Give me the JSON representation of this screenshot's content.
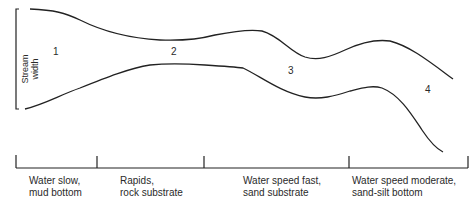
{
  "diagram": {
    "type": "stream-profile",
    "width_axis_label_line1": "Stream",
    "width_axis_label_line2": "width",
    "zones": [
      {
        "number": "1",
        "line1": "Water slow,",
        "line2": "mud bottom"
      },
      {
        "number": "2",
        "line1": "Rapids,",
        "line2": "rock substrate"
      },
      {
        "number": "3",
        "line1": "Water speed fast,",
        "line2": "sand substrate"
      },
      {
        "number": "4",
        "line1": "Water speed moderate,",
        "line2": "sand-silt bottom"
      }
    ],
    "colors": {
      "line": "#222222",
      "background": "#ffffff"
    }
  }
}
